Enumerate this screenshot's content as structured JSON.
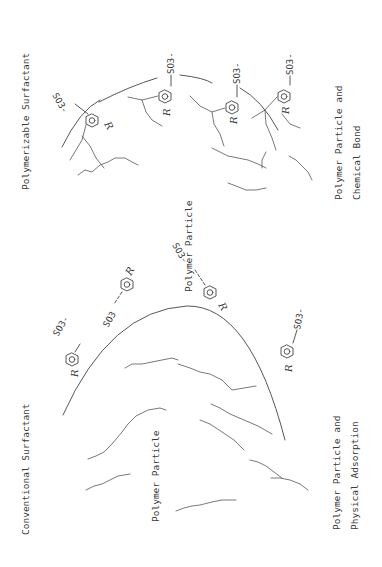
{
  "diagram": {
    "orientation": "rotated 90 degrees counter-clockwise",
    "panels": [
      {
        "id": "polymerizable",
        "title": "Polymerizable Surfactant",
        "particle_label": "Polymer Particle",
        "caption_line1": "Polymer Particle  and",
        "caption_line2": "Chemical Bond",
        "surfactants": [
          {
            "head": "SO3-",
            "ring_label": "R"
          },
          {
            "head": "SO3-",
            "ring_label": "R"
          },
          {
            "head": "SO3-",
            "ring_label": "R"
          },
          {
            "head": "SO3-",
            "ring_label": "R"
          }
        ]
      },
      {
        "id": "conventional",
        "title": "Conventional Surfactant",
        "particle_label": "Polymer Particle",
        "caption_line1": "Polymer Particle  and",
        "caption_line2": "Physical Adsorption",
        "surfactants": [
          {
            "head": "SO3-",
            "ring_label": "R"
          },
          {
            "head": "SO3",
            "ring_label": "R"
          },
          {
            "head": "SO3-",
            "ring_label": "R"
          },
          {
            "head": "SO3-",
            "ring_label": "R"
          }
        ]
      }
    ]
  },
  "colors": {
    "background": "#ffffff",
    "ink": "#3a3a3a"
  }
}
